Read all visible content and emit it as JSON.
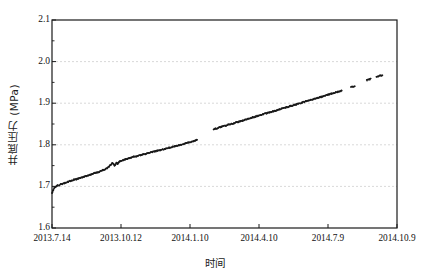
{
  "chart_data": {
    "type": "scatter",
    "title": "",
    "xlabel": "时间",
    "ylabel": "井底压力 (MPa)",
    "ylim": [
      1.6,
      2.1
    ],
    "ytick_labels": [
      "1.6",
      "1.7",
      "1.8",
      "1.9",
      "2.0",
      "2.1"
    ],
    "ytick_values": [
      1.6,
      1.7,
      1.8,
      1.9,
      2.0,
      2.1
    ],
    "y_minor_ticks": true,
    "xtick_labels": [
      "2013.7.14",
      "2013.10.12",
      "2014.1.10",
      "2014.4.10",
      "2014.7.9",
      "2014.10.9"
    ],
    "xlim_labels": [
      "2013.7.14",
      "2014.10.9"
    ],
    "grid": "horizontal-dashed",
    "legend": "none",
    "marker_color": "#1a1a1a",
    "axis_color": "#1a1a1a",
    "grid_color": "#c8c8c8",
    "series": [
      {
        "name": "井底压力",
        "points": [
          [
            0.0,
            1.684
          ],
          [
            0.004,
            1.692
          ],
          [
            0.008,
            1.697
          ],
          [
            0.012,
            1.7
          ],
          [
            0.016,
            1.702
          ],
          [
            0.021,
            1.703
          ],
          [
            0.026,
            1.705
          ],
          [
            0.031,
            1.706
          ],
          [
            0.036,
            1.708
          ],
          [
            0.041,
            1.709
          ],
          [
            0.046,
            1.711
          ],
          [
            0.052,
            1.713
          ],
          [
            0.058,
            1.714
          ],
          [
            0.064,
            1.716
          ],
          [
            0.07,
            1.717
          ],
          [
            0.076,
            1.719
          ],
          [
            0.082,
            1.72
          ],
          [
            0.088,
            1.722
          ],
          [
            0.094,
            1.723
          ],
          [
            0.1,
            1.725
          ],
          [
            0.106,
            1.727
          ],
          [
            0.112,
            1.728
          ],
          [
            0.118,
            1.73
          ],
          [
            0.124,
            1.732
          ],
          [
            0.13,
            1.733
          ],
          [
            0.136,
            1.735
          ],
          [
            0.142,
            1.737
          ],
          [
            0.148,
            1.739
          ],
          [
            0.154,
            1.741
          ],
          [
            0.16,
            1.744
          ],
          [
            0.166,
            1.748
          ],
          [
            0.17,
            1.752
          ],
          [
            0.174,
            1.756
          ],
          [
            0.178,
            1.754
          ],
          [
            0.181,
            1.75
          ],
          [
            0.184,
            1.753
          ],
          [
            0.187,
            1.757
          ],
          [
            0.19,
            1.754
          ],
          [
            0.193,
            1.757
          ],
          [
            0.196,
            1.76
          ],
          [
            0.2,
            1.761
          ],
          [
            0.206,
            1.763
          ],
          [
            0.212,
            1.765
          ],
          [
            0.218,
            1.766
          ],
          [
            0.224,
            1.768
          ],
          [
            0.23,
            1.769
          ],
          [
            0.236,
            1.771
          ],
          [
            0.243,
            1.772
          ],
          [
            0.25,
            1.774
          ],
          [
            0.257,
            1.775
          ],
          [
            0.264,
            1.777
          ],
          [
            0.271,
            1.778
          ],
          [
            0.278,
            1.78
          ],
          [
            0.285,
            1.781
          ],
          [
            0.292,
            1.783
          ],
          [
            0.299,
            1.784
          ],
          [
            0.306,
            1.786
          ],
          [
            0.313,
            1.787
          ],
          [
            0.32,
            1.789
          ],
          [
            0.327,
            1.79
          ],
          [
            0.334,
            1.792
          ],
          [
            0.341,
            1.793
          ],
          [
            0.348,
            1.795
          ],
          [
            0.355,
            1.796
          ],
          [
            0.362,
            1.798
          ],
          [
            0.369,
            1.799
          ],
          [
            0.376,
            1.801
          ],
          [
            0.383,
            1.802
          ],
          [
            0.39,
            1.804
          ],
          [
            0.397,
            1.806
          ],
          [
            0.404,
            1.807
          ],
          [
            0.411,
            1.809
          ],
          [
            0.418,
            1.811
          ],
          [
            0.419,
            1.812
          ],
          [
            0.42,
            1.813
          ],
          [
            0.468,
            1.837
          ],
          [
            0.474,
            1.839
          ],
          [
            0.48,
            1.84
          ],
          [
            0.486,
            1.842
          ],
          [
            0.492,
            1.843
          ],
          [
            0.498,
            1.845
          ],
          [
            0.504,
            1.846
          ],
          [
            0.51,
            1.848
          ],
          [
            0.516,
            1.849
          ],
          [
            0.522,
            1.851
          ],
          [
            0.528,
            1.852
          ],
          [
            0.534,
            1.854
          ],
          [
            0.54,
            1.855
          ],
          [
            0.546,
            1.857
          ],
          [
            0.552,
            1.858
          ],
          [
            0.558,
            1.86
          ],
          [
            0.564,
            1.861
          ],
          [
            0.57,
            1.863
          ],
          [
            0.576,
            1.864
          ],
          [
            0.582,
            1.866
          ],
          [
            0.588,
            1.867
          ],
          [
            0.594,
            1.869
          ],
          [
            0.6,
            1.87
          ],
          [
            0.606,
            1.872
          ],
          [
            0.612,
            1.873
          ],
          [
            0.618,
            1.875
          ],
          [
            0.624,
            1.876
          ],
          [
            0.63,
            1.878
          ],
          [
            0.636,
            1.879
          ],
          [
            0.642,
            1.881
          ],
          [
            0.648,
            1.882
          ],
          [
            0.654,
            1.884
          ],
          [
            0.66,
            1.885
          ],
          [
            0.666,
            1.887
          ],
          [
            0.672,
            1.888
          ],
          [
            0.678,
            1.89
          ],
          [
            0.684,
            1.891
          ],
          [
            0.69,
            1.893
          ],
          [
            0.696,
            1.894
          ],
          [
            0.702,
            1.896
          ],
          [
            0.708,
            1.897
          ],
          [
            0.714,
            1.899
          ],
          [
            0.72,
            1.9
          ],
          [
            0.726,
            1.902
          ],
          [
            0.732,
            1.903
          ],
          [
            0.738,
            1.905
          ],
          [
            0.744,
            1.906
          ],
          [
            0.75,
            1.908
          ],
          [
            0.756,
            1.909
          ],
          [
            0.762,
            1.911
          ],
          [
            0.768,
            1.912
          ],
          [
            0.774,
            1.914
          ],
          [
            0.78,
            1.915
          ],
          [
            0.786,
            1.917
          ],
          [
            0.792,
            1.918
          ],
          [
            0.798,
            1.92
          ],
          [
            0.804,
            1.921
          ],
          [
            0.81,
            1.923
          ],
          [
            0.816,
            1.924
          ],
          [
            0.822,
            1.926
          ],
          [
            0.828,
            1.927
          ],
          [
            0.834,
            1.929
          ],
          [
            0.84,
            1.93
          ],
          [
            0.866,
            1.938
          ],
          [
            0.872,
            1.94
          ],
          [
            0.878,
            1.941
          ],
          [
            0.912,
            1.955
          ],
          [
            0.918,
            1.957
          ],
          [
            0.924,
            1.958
          ],
          [
            0.94,
            1.963
          ],
          [
            0.946,
            1.965
          ],
          [
            0.952,
            1.966
          ],
          [
            0.958,
            1.967
          ]
        ]
      }
    ],
    "gaps": [
      {
        "after_x": 0.42,
        "before_x": 0.468
      },
      {
        "after_x": 0.84,
        "before_x": 0.866
      },
      {
        "after_x": 0.878,
        "before_x": 0.912
      },
      {
        "after_x": 0.924,
        "before_x": 0.94
      }
    ]
  },
  "plot_geometry": {
    "left": 52,
    "right": 397,
    "top": 20,
    "bottom": 228
  }
}
